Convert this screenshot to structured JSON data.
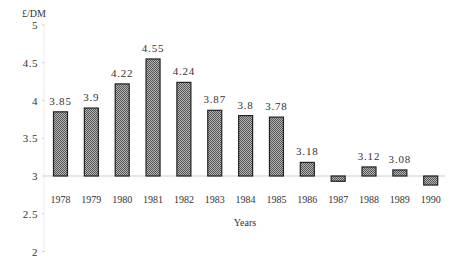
{
  "chart_data": {
    "type": "bar",
    "title": "",
    "ylabel": "£/DM",
    "xlabel": "Years",
    "ylim": [
      2,
      5
    ],
    "baseline": 3,
    "yticks": [
      2,
      2.5,
      3,
      3.5,
      4,
      4.5,
      5
    ],
    "ytick_labels": [
      "2",
      "2.5",
      "3",
      "3.5",
      "4",
      "4.5",
      "5"
    ],
    "grid": false,
    "legend": null,
    "categories": [
      "1978",
      "1979",
      "1980",
      "1981",
      "1982",
      "1983",
      "1984",
      "1985",
      "1986",
      "1987",
      "1988",
      "1989",
      "1990"
    ],
    "values": [
      3.85,
      3.9,
      4.22,
      4.55,
      4.24,
      3.87,
      3.8,
      3.78,
      3.18,
      2.93,
      3.12,
      3.08,
      2.88
    ],
    "data_labels": [
      "3.85",
      "3.9",
      "4.22",
      "4.55",
      "4.24",
      "3.87",
      "3.8",
      "3.78",
      "3.18",
      "",
      "3.12",
      "3.08",
      ""
    ],
    "bar_fill": "#8a8a8a",
    "bar_stroke": "#222222",
    "baseline_color": "#cfcfcf"
  }
}
